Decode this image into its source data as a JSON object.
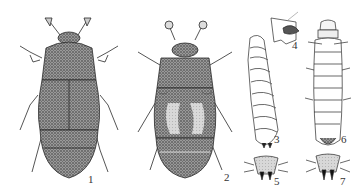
{
  "plate": {
    "background": "#ffffff",
    "ink_color": "#2a2a2a",
    "stipple_color": "#6b6b6b",
    "figures": [
      {
        "number": "1",
        "subject": "adult beetle, dorsal view, uniformly dark stippled"
      },
      {
        "number": "2",
        "subject": "adult beetle, dorsal view, with pale elytral patches"
      },
      {
        "number": "3",
        "subject": "larva, lateral view"
      },
      {
        "number": "4",
        "subject": "larval mouthpart / head detail"
      },
      {
        "number": "5",
        "subject": "larval terminal segment with urogomphi"
      },
      {
        "number": "6",
        "subject": "larva, dorsal view"
      },
      {
        "number": "7",
        "subject": "larval terminal segment with urogomphi"
      }
    ]
  }
}
